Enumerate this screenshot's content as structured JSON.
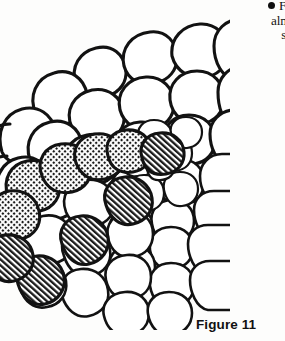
{
  "page": {
    "background_color": "#fdfdfc",
    "ink_color": "#121212",
    "width": 285,
    "height": 341
  },
  "body_text": {
    "bullet_glyph": "●",
    "lines": [
      "Fina",
      "almos",
      "slan"
    ],
    "line1": "Fina",
    "line2": "almos",
    "line3": "slan",
    "note": "text truncated at right page margin"
  },
  "caption": {
    "label": "Figure 11"
  },
  "figure": {
    "shading": {
      "dotted_pattern_name": "stipple-crosshatch",
      "hatched_pattern_name": "diagonal-hatch",
      "dotted_scale_count": 5,
      "hatched_scale_count": 5
    }
  }
}
